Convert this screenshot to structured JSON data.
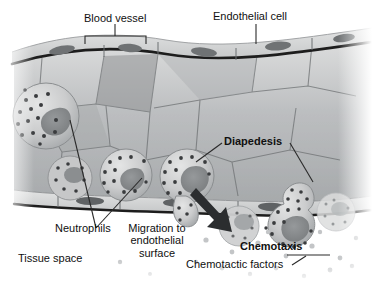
{
  "figure": {
    "kind": "biology-illustration",
    "palette": {
      "background": "#ffffff",
      "text": "#101010",
      "leader_line": "#2a2a2a",
      "vessel_lumen_light": "#d8d9da",
      "vessel_lumen_mid": "#b6b8b9",
      "vessel_lumen_dark": "#8d9092",
      "vessel_wall_line": "#1d1d1d",
      "endothelium_fill": "#cfd0d1",
      "endothelial_nucleus": "#6f7274",
      "neutrophil_fill": "#c9cacb",
      "neutrophil_nucleus": "#85888a",
      "granule": "#3a3c3e",
      "arrow": "#2b2d2f",
      "chemotactic_dot": "#c3c5c7",
      "tissue_space": "#fbfbfb"
    }
  },
  "labels": {
    "blood_vessel": "Blood vessel",
    "endothelial_cell": "Endothelial cell",
    "diapedesis": "Diapedesis",
    "neutrophils": "Neutrophils",
    "migration_line1": "Migration to",
    "migration_line2": "endothelial",
    "migration_line3": "surface",
    "chemotaxis": "Chemotaxis",
    "chemotactic_factors": "Chemotactic factors",
    "tissue_space": "Tissue space"
  },
  "annotations": {
    "bold_labels": [
      "Diapedesis",
      "Chemotaxis"
    ],
    "bracket": {
      "for": "Blood vessel",
      "x_start": 85,
      "x_end": 146,
      "y": 38
    },
    "leaders": [
      {
        "label": "Endothelial cell",
        "type": "vertical-line"
      },
      {
        "label": "Diapedesis",
        "type": "two-branch"
      },
      {
        "label": "Neutrophils",
        "type": "two-branch"
      },
      {
        "label": "Migration to endothelial surface",
        "type": "none"
      },
      {
        "label": "Chemotactic factors",
        "type": "horizontal-with-tick"
      }
    ],
    "arrow": {
      "for": "Chemotaxis",
      "direction": "down-right"
    }
  }
}
